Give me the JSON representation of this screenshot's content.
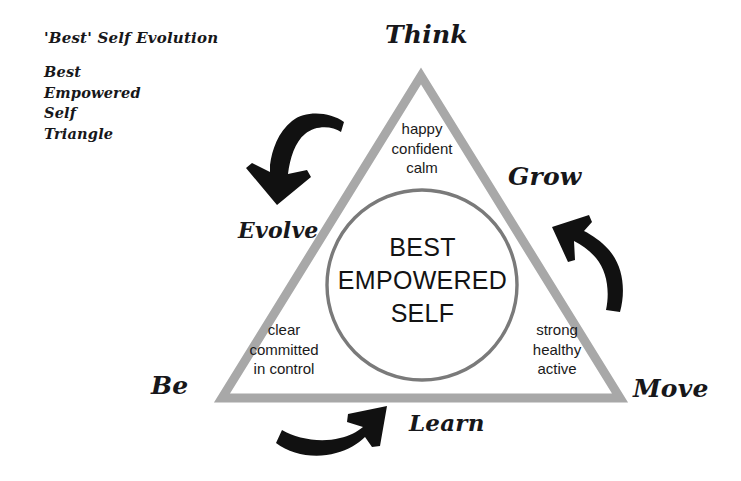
{
  "canvas": {
    "width": 741,
    "height": 481,
    "background": "#ffffff"
  },
  "colors": {
    "triangle_stroke": "#a8a8a8",
    "circle_stroke": "#7a7a7a",
    "arrow_fill": "#111111",
    "text": "#17171a"
  },
  "caption": {
    "title": "'Best' Self Evolution",
    "words": [
      "Best",
      "Empowered",
      "Self",
      "Triangle"
    ]
  },
  "diagram": {
    "center": {
      "line1": "BEST",
      "line2": "EMPOWERED",
      "line3": "SELF"
    },
    "vertices": [
      {
        "id": "think",
        "label": "Think"
      },
      {
        "id": "grow",
        "label": "Grow"
      },
      {
        "id": "move",
        "label": "Move"
      },
      {
        "id": "be",
        "label": "Be"
      }
    ],
    "cycle_labels": [
      {
        "id": "evolve",
        "label": "Evolve"
      },
      {
        "id": "learn",
        "label": "Learn"
      }
    ],
    "attributes": [
      {
        "id": "think",
        "position": "top",
        "words": [
          "happy",
          "confident",
          "calm"
        ]
      },
      {
        "id": "be",
        "position": "bottom-left",
        "words": [
          "clear",
          "committed",
          "in control"
        ]
      },
      {
        "id": "move",
        "position": "bottom-right",
        "words": [
          "strong",
          "healthy",
          "active"
        ]
      }
    ],
    "arrows": [
      {
        "id": "evolve-arrow",
        "direction": "down-left",
        "name": "curved-arrow-down-left"
      },
      {
        "id": "grow-arrow",
        "direction": "up-left",
        "name": "curved-arrow-up-left"
      },
      {
        "id": "learn-arrow",
        "direction": "right",
        "name": "curved-arrow-right"
      }
    ]
  }
}
